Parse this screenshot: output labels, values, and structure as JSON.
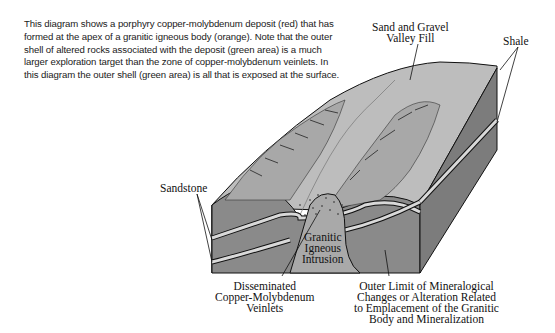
{
  "caption": "This diagram shows a porphyry copper-molybdenum deposit (red) that has formed at the apex of a granitic igneous body (orange). Note that the outer shell of altered rocks associated with the deposit (green area) is a much larger exploration target than the zone of copper-molybdenum veinlets. In this diagram the outer shell (green area) is all that is exposed at the surface.",
  "labels": {
    "valley_fill": [
      "Sand and Gravel",
      "Valley Fill"
    ],
    "shale": "Shale",
    "sandstone": "Sandstone",
    "intrusion": [
      "Granitic",
      "Igneous",
      "Intrusion"
    ],
    "veinlets": [
      "Disseminated",
      "Copper-Molybdenum",
      "Veinlets"
    ],
    "outer_limit": [
      "Outer Limit of Mineralogical",
      "Changes or Alteration Related",
      "to Emplacement of the Granitic",
      "Body and Mineralization"
    ]
  },
  "colors": {
    "top_surface": "#bdbdbd",
    "front_face": "#8a8a8a",
    "side_face": "#7c7c7c",
    "sandstone_band": "#d9d9d9",
    "intrusion": "#a9a9a9",
    "outline": "#111111"
  }
}
